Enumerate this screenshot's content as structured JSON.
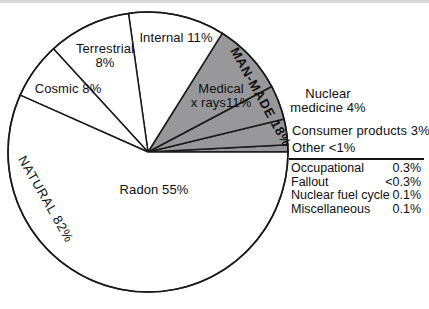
{
  "chart_data": {
    "type": "pie",
    "title": "",
    "legend_position": "none",
    "groups": [
      {
        "name": "natural",
        "label": "NATURAL 82%",
        "value_pct": 82,
        "fill": "#ffffff"
      },
      {
        "name": "man-made",
        "label": "MAN-MADE 18%",
        "value_pct": 18,
        "fill": "#98989a"
      }
    ],
    "slices": [
      {
        "name": "other",
        "label": "Other <1%",
        "value_display": "<1%",
        "value_num": 0.8,
        "group": "man-made"
      },
      {
        "name": "consumer-products",
        "label": "Consumer products 3%",
        "value_display": "3%",
        "value_num": 3,
        "group": "man-made"
      },
      {
        "name": "nuclear-medicine",
        "label": "Nuclear medicine 4%",
        "value_display": "4%",
        "value_num": 4,
        "group": "man-made"
      },
      {
        "name": "medical-x-rays",
        "label": "Medical x rays11%",
        "value_display": "11%",
        "value_num": 11,
        "group": "man-made"
      },
      {
        "name": "internal",
        "label": "Internal 11%",
        "value_display": "11%",
        "value_num": 11,
        "group": "natural"
      },
      {
        "name": "terrestrial",
        "label": "Terrestrial 8%",
        "value_display": "8%",
        "value_num": 8,
        "group": "natural"
      },
      {
        "name": "cosmic",
        "label": "Cosmic 8%",
        "value_display": "8%",
        "value_num": 8,
        "group": "natural"
      },
      {
        "name": "radon",
        "label": "Radon 55%",
        "value_display": "55%",
        "value_num": 55,
        "group": "natural"
      }
    ],
    "other_breakdown": {
      "heading": "Other <1%",
      "rows": [
        {
          "label": "Occupational",
          "value": "0.3%"
        },
        {
          "label": "Fallout",
          "value": "<0.3%"
        },
        {
          "label": "Nuclear fuel cycle",
          "value": "0.1%"
        },
        {
          "label": "Miscellaneous",
          "value": "0.1%"
        }
      ]
    },
    "colors": {
      "natural_fill": "#ffffff",
      "man_made_fill": "#98989a",
      "stroke": "#1a1a1a"
    },
    "geometry": {
      "cx": 148,
      "cy": 152,
      "r": 140,
      "start_angle_deg": 0,
      "direction": "ccw",
      "boundaries_deg": [
        0,
        3,
        13.6,
        27.9,
        58,
        98,
        132.5,
        156,
        360
      ]
    }
  },
  "labels": {
    "internal": "Internal 11%",
    "terrestrial_line1": "Terrestrial",
    "terrestrial_line2": "8%",
    "cosmic": "Cosmic 8%",
    "radon": "Radon 55%",
    "medical_line1": "Medical",
    "medical_line2": "x rays11%",
    "natural_arc": "NATURAL 82%",
    "manmade_arc": "MAN-MADE 18%",
    "nuclear_line1": "Nuclear",
    "nuclear_line2": "medicine 4%",
    "consumer": "Consumer products 3%",
    "other": "Other <1%"
  }
}
